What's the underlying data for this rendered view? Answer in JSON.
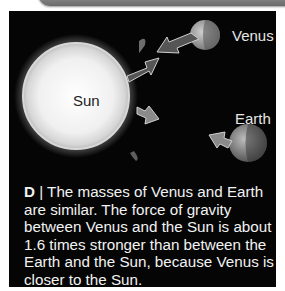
{
  "figure": {
    "panel_letter": "D",
    "separator": "|",
    "caption": "The masses of Venus and Earth are similar. The force of gravity between Venus and the Sun is about 1.6 times stronger than between the Earth and the Sun, because Venus is closer to the Sun.",
    "labels": {
      "sun": "Sun",
      "venus": "Venus",
      "earth": "Earth"
    },
    "colors": {
      "background": "#050505",
      "venus_arrows": "#555555",
      "earth_arrows": "#8a8a8a",
      "text": "#f2f2f2"
    }
  }
}
